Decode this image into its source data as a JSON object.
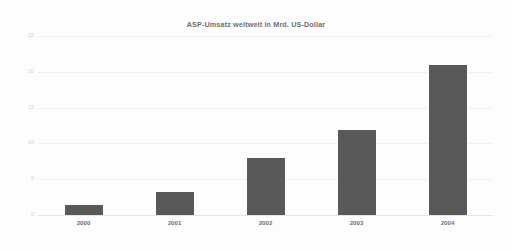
{
  "chart_data": {
    "type": "bar",
    "title": "ASP-Umsatz weltweit in Mrd. US-Dollar",
    "xlabel": "",
    "ylabel": "",
    "categories": [
      "2000",
      "2001",
      "2002",
      "2003",
      "2004"
    ],
    "values": [
      1.4,
      3.2,
      8.0,
      11.9,
      21.0
    ],
    "ylim": [
      0,
      25
    ],
    "yticks": [
      0,
      5,
      10,
      15,
      20,
      25
    ],
    "ytick_labels": [
      "0",
      "5",
      "10",
      "15",
      "20",
      "25"
    ],
    "grid": true,
    "legend": null,
    "series": [
      {
        "name": "ASP-Umsatz",
        "values": [
          1.4,
          3.2,
          8.0,
          11.9,
          21.0
        ]
      }
    ],
    "colors": {
      "bar": "#595959",
      "background": "#fdfdfd",
      "gridline": "#f0f0f0",
      "title_text": "#6f6f6f",
      "xtick_text": "#707070",
      "ytick_text": "#cfcfcf"
    }
  }
}
